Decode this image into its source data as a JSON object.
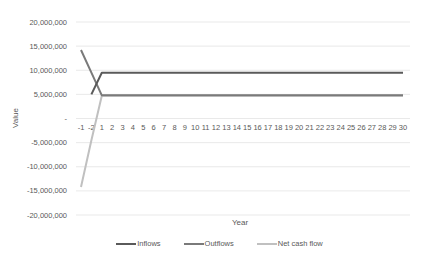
{
  "chart_data": {
    "type": "line",
    "title": "",
    "xlabel": "Year",
    "ylabel": "Value",
    "categories": [
      "-1",
      "-2",
      "1",
      "2",
      "3",
      "4",
      "5",
      "6",
      "7",
      "8",
      "9",
      "10",
      "11",
      "12",
      "13",
      "14",
      "15",
      "16",
      "17",
      "18",
      "19",
      "20",
      "21",
      "22",
      "23",
      "24",
      "25",
      "26",
      "27",
      "28",
      "29",
      "30"
    ],
    "ylim": [
      -20000000,
      20000000
    ],
    "yticks": [
      20000000,
      15000000,
      10000000,
      5000000,
      0,
      -5000000,
      -10000000,
      -15000000,
      -20000000
    ],
    "ytick_labels": [
      "20,000,000",
      "15,000,000",
      "10,000,000",
      "5,000,000",
      "-",
      "-5,000,000",
      "-10,000,000",
      "-15,000,000",
      "-20,000,000"
    ],
    "grid": true,
    "legend_position": "bottom",
    "series": [
      {
        "name": "Inflows",
        "color": "#5a5a5a",
        "values": [
          null,
          5000000,
          9500000,
          9500000,
          9500000,
          9500000,
          9500000,
          9500000,
          9500000,
          9500000,
          9500000,
          9500000,
          9500000,
          9500000,
          9500000,
          9500000,
          9500000,
          9500000,
          9500000,
          9500000,
          9500000,
          9500000,
          9500000,
          9500000,
          9500000,
          9500000,
          9500000,
          9500000,
          9500000,
          9500000,
          9500000,
          9500000
        ]
      },
      {
        "name": "Outflows",
        "color": "#7a7a7a",
        "values": [
          14200000,
          9500000,
          4800000,
          4800000,
          4800000,
          4800000,
          4800000,
          4800000,
          4800000,
          4800000,
          4800000,
          4800000,
          4800000,
          4800000,
          4800000,
          4800000,
          4800000,
          4800000,
          4800000,
          4800000,
          4800000,
          4800000,
          4800000,
          4800000,
          4800000,
          4800000,
          4800000,
          4800000,
          4800000,
          4800000,
          4800000,
          4800000
        ]
      },
      {
        "name": "Net cash flow",
        "color": "#c0c0c0",
        "values": [
          -14200000,
          -4500000,
          4700000,
          4700000,
          4700000,
          4700000,
          4700000,
          4700000,
          4700000,
          4700000,
          4700000,
          4700000,
          4700000,
          4700000,
          4700000,
          4700000,
          4700000,
          4700000,
          4700000,
          4700000,
          4700000,
          4700000,
          4700000,
          4700000,
          4700000,
          4700000,
          4700000,
          4700000,
          4700000,
          4700000,
          4700000,
          4700000
        ]
      }
    ]
  },
  "legend": {
    "items": [
      {
        "label": "Inflows",
        "color": "#5a5a5a"
      },
      {
        "label": "Outflows",
        "color": "#7a7a7a"
      },
      {
        "label": "Net cash flow",
        "color": "#c0c0c0"
      }
    ]
  }
}
